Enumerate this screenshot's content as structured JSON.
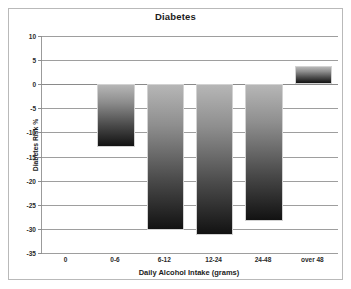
{
  "chart_data": {
    "type": "bar",
    "title": "Diabetes",
    "xlabel": "Daily Alcohol Intake (grams)",
    "ylabel": "Diabetes Risk %",
    "categories": [
      "0",
      "0-6",
      "6-12",
      "12-24",
      "24-48",
      "over 48"
    ],
    "values": [
      0,
      -13.1,
      -30.2,
      -31.3,
      -28.3,
      3.7
    ],
    "series": [
      {
        "name": "Diabetes Risk %",
        "values": [
          0,
          -13.1,
          -30.2,
          -31.3,
          -28.3,
          3.7
        ]
      }
    ],
    "ylim": [
      -35,
      10
    ],
    "ytick_labels": [
      "10",
      "5",
      "0",
      "-5",
      "-10",
      "-15",
      "-20",
      "-25",
      "-30",
      "-35"
    ],
    "ytick_values": [
      10,
      5,
      0,
      -5,
      -10,
      -15,
      -20,
      -25,
      -30,
      -35
    ],
    "grid": true,
    "legend": "none",
    "bar_gradient_top_color": "#b6b6b6",
    "bar_gradient_bottom_color": "#121212",
    "gridline_color": "#9e9e9e",
    "frame_color": "#b9b9b9",
    "text_color": "#1b1b1b"
  }
}
